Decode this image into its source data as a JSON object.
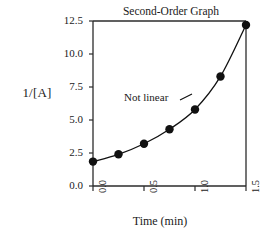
{
  "chart_data": {
    "type": "scatter",
    "title": "Second-Order Graph",
    "xlabel": "Time (min)",
    "ylabel": "1/[A]",
    "annotations": [
      "Not linear"
    ],
    "xlim": [
      0.0,
      1.5
    ],
    "ylim": [
      0.0,
      12.5
    ],
    "xticks": [
      "0.0",
      "0.5",
      "1.0",
      "1.5"
    ],
    "xtick_values": [
      0.0,
      0.5,
      1.0,
      1.5
    ],
    "yticks": [
      "0.0",
      "2.5",
      "5.0",
      "7.5",
      "10.0",
      "12.5"
    ],
    "ytick_values": [
      0.0,
      2.5,
      5.0,
      7.5,
      10.0,
      12.5
    ],
    "grid": false,
    "legend": null,
    "marker": "filled-circle",
    "line": "smooth-curve",
    "series": [
      {
        "name": "1/[A] vs time",
        "x": [
          0.0,
          0.25,
          0.5,
          0.75,
          1.0,
          1.25,
          1.5
        ],
        "values": [
          1.85,
          2.4,
          3.2,
          4.3,
          5.8,
          8.3,
          12.2
        ]
      }
    ]
  },
  "axes": {
    "title": "Second-Order Graph",
    "ylabel": "1/[A]",
    "xlabel": "Time (min)",
    "annotation": "Not linear"
  }
}
